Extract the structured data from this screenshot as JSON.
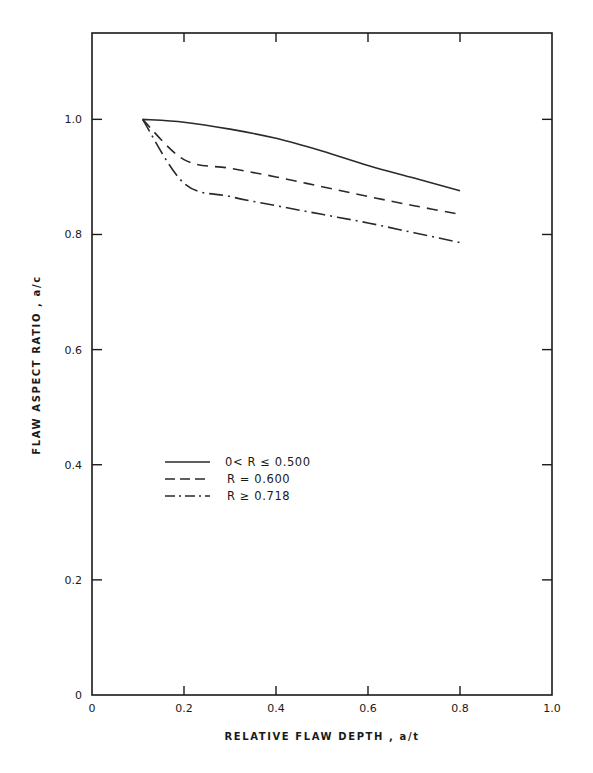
{
  "chart_data": {
    "type": "line",
    "title": "",
    "xlabel": "RELATIVE FLAW DEPTH , a/t",
    "ylabel": "FLAW ASPECT RATIO , a/c",
    "xlim": [
      0,
      1.0
    ],
    "ylim": [
      0,
      1.15
    ],
    "xticks": [
      "0",
      "0.2",
      "0.4",
      "0.6",
      "0.8",
      "1.0"
    ],
    "yticks": [
      "0",
      "0.2",
      "0.4",
      "0.6",
      "0.8",
      "1.0"
    ],
    "grid": false,
    "legend_position": "inside-middle-left",
    "x": [
      0.11,
      0.2,
      0.3,
      0.4,
      0.5,
      0.6,
      0.7,
      0.8
    ],
    "series": [
      {
        "name": "0< R ≤ 0.500",
        "style": "solid",
        "values": [
          1.0,
          0.995,
          0.983,
          0.967,
          0.945,
          0.92,
          0.898,
          0.876
        ]
      },
      {
        "name": "R = 0.600",
        "style": "dashed",
        "values": [
          1.0,
          0.93,
          0.915,
          0.9,
          0.883,
          0.866,
          0.85,
          0.835
        ]
      },
      {
        "name": "R ≥ 0.718",
        "style": "dashdot",
        "values": [
          1.0,
          0.889,
          0.866,
          0.85,
          0.835,
          0.82,
          0.803,
          0.786
        ]
      }
    ]
  }
}
